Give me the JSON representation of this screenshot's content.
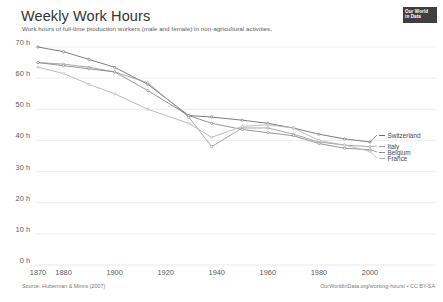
{
  "header": {
    "title": "Weekly Work Hours",
    "subtitle": "Work hours of full-time production workers (male and female) in non-agricultural activities."
  },
  "logo": {
    "line1": "Our World",
    "line2": "in Data"
  },
  "footer": {
    "source": "Source: Huberman & Minns (2007)",
    "url": "OurWorldInData.org/working-hours/ • CC BY-SA"
  },
  "colors": {
    "grid": "#e8e8e8",
    "axis_text": "#5b5b5b",
    "line_switzerland": "#6e6e6e",
    "line_italy": "#9d9d9d",
    "line_belgium": "#8a8a8a",
    "line_france": "#b5b5b5",
    "logo_bg": "#3f3f3f",
    "title": "#333333"
  },
  "chart_data": {
    "type": "line",
    "title": "Weekly Work Hours",
    "subtitle": "Work hours of full-time production workers (male and female) in non-agricultural activities.",
    "xlabel": "",
    "ylabel": "",
    "xlim": [
      1870,
      2000
    ],
    "ylim": [
      0,
      70
    ],
    "grid": true,
    "legend_position": "right",
    "y_ticks": [
      0,
      10,
      20,
      30,
      40,
      50,
      60,
      70
    ],
    "y_tick_labels": [
      "0 h",
      "10 h",
      "20 h",
      "30 h",
      "40 h",
      "50 h",
      "60 h",
      "70 h"
    ],
    "x_ticks": [
      1870,
      1880,
      1900,
      1920,
      1940,
      1960,
      1980,
      2000
    ],
    "x_tick_labels": [
      "1870",
      "1880",
      "1900",
      "1920",
      "1940",
      "1960",
      "1980",
      "2000"
    ],
    "series": [
      {
        "name": "Switzerland",
        "color": "#6e6e6e",
        "points": [
          {
            "x": 1870,
            "y": 70.0
          },
          {
            "x": 1880,
            "y": 68.5
          },
          {
            "x": 1890,
            "y": 66.0
          },
          {
            "x": 1900,
            "y": 63.5
          },
          {
            "x": 1913,
            "y": 58.0
          },
          {
            "x": 1929,
            "y": 48.0
          },
          {
            "x": 1938,
            "y": 47.5
          },
          {
            "x": 1950,
            "y": 46.5
          },
          {
            "x": 1960,
            "y": 45.5
          },
          {
            "x": 1970,
            "y": 44.0
          },
          {
            "x": 1980,
            "y": 42.0
          },
          {
            "x": 1990,
            "y": 40.5
          },
          {
            "x": 2000,
            "y": 39.5
          }
        ]
      },
      {
        "name": "Italy",
        "color": "#9d9d9d",
        "points": [
          {
            "x": 1870,
            "y": 65.0
          },
          {
            "x": 1880,
            "y": 64.5
          },
          {
            "x": 1890,
            "y": 63.5
          },
          {
            "x": 1900,
            "y": 62.0
          },
          {
            "x": 1913,
            "y": 58.5
          },
          {
            "x": 1929,
            "y": 47.5
          },
          {
            "x": 1938,
            "y": 38.0
          },
          {
            "x": 1950,
            "y": 44.0
          },
          {
            "x": 1960,
            "y": 44.0
          },
          {
            "x": 1970,
            "y": 42.0
          },
          {
            "x": 1980,
            "y": 39.5
          },
          {
            "x": 1990,
            "y": 38.5
          },
          {
            "x": 2000,
            "y": 38.0
          }
        ]
      },
      {
        "name": "Belgium",
        "color": "#8a8a8a",
        "points": [
          {
            "x": 1870,
            "y": 65.0
          },
          {
            "x": 1880,
            "y": 64.0
          },
          {
            "x": 1890,
            "y": 63.0
          },
          {
            "x": 1900,
            "y": 62.0
          },
          {
            "x": 1913,
            "y": 56.0
          },
          {
            "x": 1929,
            "y": 48.0
          },
          {
            "x": 1938,
            "y": 45.5
          },
          {
            "x": 1950,
            "y": 43.5
          },
          {
            "x": 1960,
            "y": 42.5
          },
          {
            "x": 1970,
            "y": 41.5
          },
          {
            "x": 1980,
            "y": 39.0
          },
          {
            "x": 1990,
            "y": 37.5
          },
          {
            "x": 2000,
            "y": 37.0
          }
        ]
      },
      {
        "name": "France",
        "color": "#b5b5b5",
        "points": [
          {
            "x": 1870,
            "y": 63.5
          },
          {
            "x": 1880,
            "y": 61.5
          },
          {
            "x": 1890,
            "y": 58.0
          },
          {
            "x": 1900,
            "y": 55.0
          },
          {
            "x": 1913,
            "y": 50.0
          },
          {
            "x": 1929,
            "y": 45.5
          },
          {
            "x": 1938,
            "y": 41.0
          },
          {
            "x": 1950,
            "y": 44.5
          },
          {
            "x": 1960,
            "y": 45.0
          },
          {
            "x": 1970,
            "y": 44.0
          },
          {
            "x": 1980,
            "y": 40.0
          },
          {
            "x": 1990,
            "y": 38.5
          },
          {
            "x": 2000,
            "y": 36.5
          }
        ]
      }
    ]
  },
  "legend": [
    {
      "label": "Switzerland",
      "top": 0
    },
    {
      "label": "Italy",
      "top": 11
    },
    {
      "label": "Belgium",
      "top": 17
    },
    {
      "label": "France",
      "top": 23
    }
  ]
}
